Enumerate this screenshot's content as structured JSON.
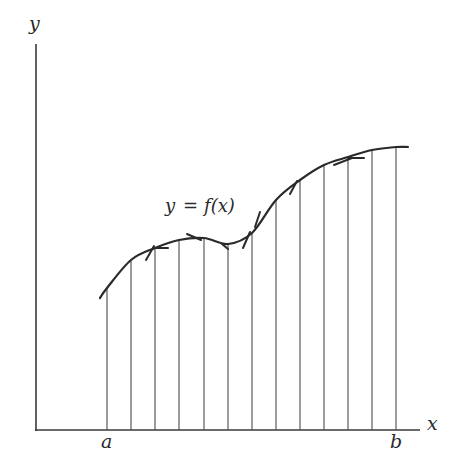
{
  "chart_data": {
    "type": "line",
    "title": "",
    "xlabel": "x",
    "ylabel": "y",
    "curve_label": "y = f(x)",
    "interval_labels": {
      "start": "a",
      "end": "b"
    },
    "grid": false,
    "legend": null,
    "ordinates_px_x": [
      107,
      131,
      155,
      179,
      204,
      228,
      252,
      276,
      300,
      324,
      348,
      372,
      396
    ],
    "curve_points_px": [
      [
        100,
        298
      ],
      [
        107,
        288
      ],
      [
        131,
        260
      ],
      [
        155,
        248
      ],
      [
        179,
        240
      ],
      [
        204,
        238
      ],
      [
        228,
        244
      ],
      [
        252,
        233
      ],
      [
        276,
        200
      ],
      [
        300,
        180
      ],
      [
        324,
        165
      ],
      [
        348,
        157
      ],
      [
        372,
        150
      ],
      [
        396,
        147
      ],
      [
        408,
        147
      ]
    ],
    "axis_origin_px": [
      36,
      430
    ]
  },
  "labels": {
    "y_axis": "y",
    "x_axis": "x",
    "a": "a",
    "b": "b",
    "equation_y": "y",
    "equation_eq": "=",
    "equation_f": "f(x)"
  }
}
